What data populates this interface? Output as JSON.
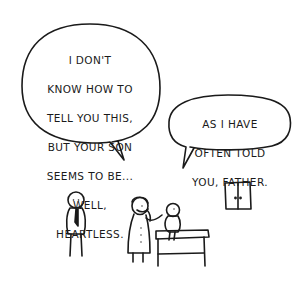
{
  "comic": {
    "panel_count": 1,
    "background": "#ffffff",
    "ink_color": "#1a1a1a",
    "speech_bubbles": [
      {
        "speaker": "doctor",
        "lines": [
          "I DON'T",
          "KNOW HOW TO",
          "TELL YOU THIS,",
          "BUT YOUR SON",
          "SEEMS TO BE...",
          "WELL,",
          "HEARTLESS."
        ]
      },
      {
        "speaker": "son",
        "lines": [
          "AS I HAVE",
          "OFTEN TOLD",
          "YOU, FATHER."
        ]
      }
    ],
    "characters": [
      {
        "name": "father",
        "description": "stick figure wearing a tie, standing"
      },
      {
        "name": "doctor",
        "description": "figure in lab coat with stethoscope"
      },
      {
        "name": "son",
        "description": "small figure sitting on examination table"
      }
    ],
    "props": [
      {
        "name": "examination-table"
      },
      {
        "name": "cabinet",
        "description": "wall cabinet with two doors"
      }
    ]
  }
}
